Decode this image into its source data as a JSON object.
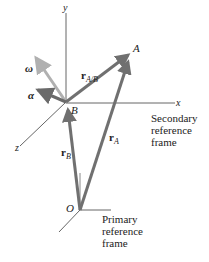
{
  "diagram": {
    "type": "relative-motion-reference-frames",
    "colors": {
      "axis": "#555555",
      "vector": "#707070",
      "omega_vector": "#b0b0b0",
      "alpha_vector": "#6a6a6a",
      "text": "#222222"
    },
    "points": {
      "A": "A",
      "B": "B",
      "O": "O"
    },
    "axes": {
      "x": "x",
      "y": "y",
      "z": "z"
    },
    "vectors": {
      "omega": "ω",
      "alpha": "α",
      "r_AB_main": "r",
      "r_AB_sub": "A/B",
      "r_A_main": "r",
      "r_A_sub": "A",
      "r_B_main": "r",
      "r_B_sub": "B"
    },
    "captions": {
      "secondary": [
        "Secondary",
        "reference",
        "frame"
      ],
      "primary": [
        "Primary",
        "reference",
        "frame"
      ]
    }
  }
}
